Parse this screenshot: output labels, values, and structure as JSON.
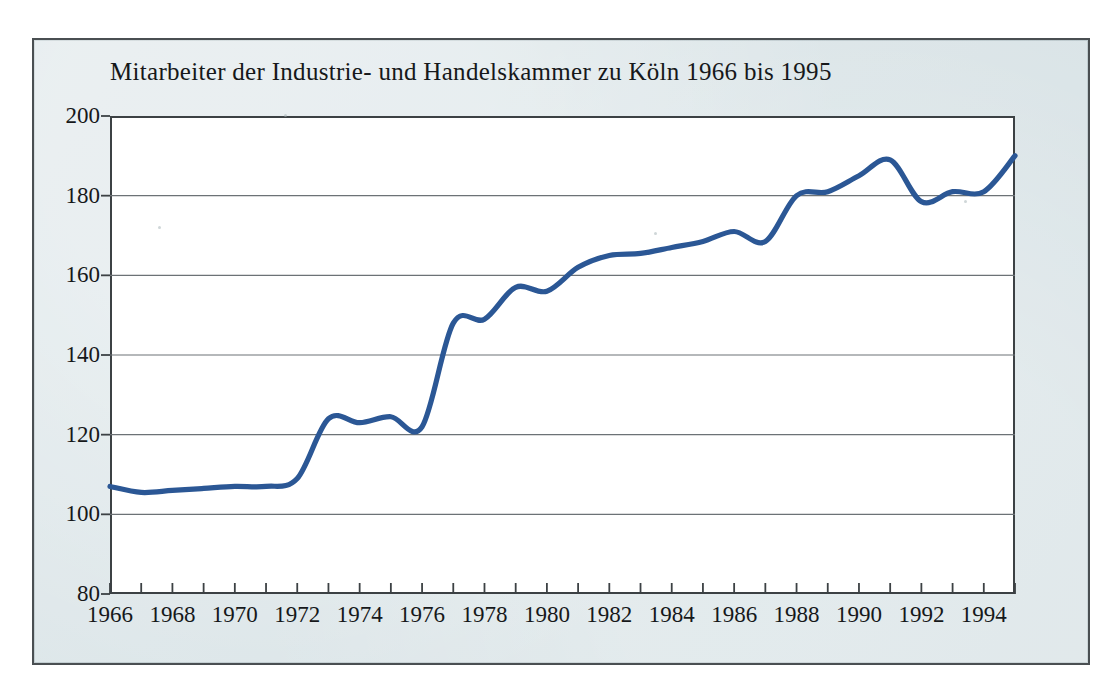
{
  "figure": {
    "title": "Mitarbeiter der Industrie- und Handelskammer zu Köln 1966 bis 1995",
    "panel_color": "#dbe5e8",
    "frame_color": "#4a4f52",
    "plot_background": "#ffffff",
    "line_color": "#2b5795",
    "grid_color": "#6c7276",
    "axis_color": "#3c4144"
  },
  "chart_data": {
    "type": "line",
    "title": "Mitarbeiter der Industrie- und Handelskammer zu Köln 1966 bis 1995",
    "xlabel": "",
    "ylabel": "",
    "xlim": [
      1966,
      1995
    ],
    "ylim": [
      80,
      200
    ],
    "ytick_step": 20,
    "xtick_step": 1,
    "xticklabel_step": 2,
    "grid": "horizontal",
    "legend": "none",
    "x": [
      1966,
      1967,
      1968,
      1969,
      1970,
      1971,
      1972,
      1973,
      1974,
      1975,
      1976,
      1977,
      1978,
      1979,
      1980,
      1981,
      1982,
      1983,
      1984,
      1985,
      1986,
      1987,
      1988,
      1989,
      1990,
      1991,
      1992,
      1993,
      1994,
      1995
    ],
    "values": [
      107,
      105.5,
      106,
      106.5,
      107,
      107,
      109,
      124,
      123,
      124.5,
      122,
      148,
      149,
      157,
      156,
      162,
      165,
      165.5,
      167,
      168.5,
      171,
      168.5,
      180,
      181,
      185,
      189,
      178.5,
      181,
      181,
      190
    ],
    "yticks": [
      80,
      100,
      120,
      140,
      160,
      180,
      200
    ],
    "ytick_labels": [
      "80",
      "100",
      "120",
      "140",
      "160",
      "180",
      "200"
    ],
    "xticks": [
      1966,
      1967,
      1968,
      1969,
      1970,
      1971,
      1972,
      1973,
      1974,
      1975,
      1976,
      1977,
      1978,
      1979,
      1980,
      1981,
      1982,
      1983,
      1984,
      1985,
      1986,
      1987,
      1988,
      1989,
      1990,
      1991,
      1992,
      1993,
      1994,
      1995
    ],
    "xtick_labels": [
      "1966",
      "",
      "1968",
      "",
      "1970",
      "",
      "1972",
      "",
      "1974",
      "",
      "1976",
      "",
      "1978",
      "",
      "1980",
      "",
      "1982",
      "",
      "1984",
      "",
      "1986",
      "",
      "1988",
      "",
      "1990",
      "",
      "1992",
      "",
      "1994",
      ""
    ]
  }
}
